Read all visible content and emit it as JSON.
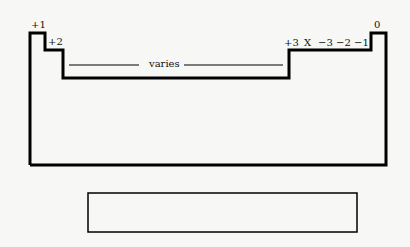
{
  "diagram": {
    "type": "periodic-table-outline",
    "group_labels": {
      "g1": "+1",
      "g2": "+2",
      "transition": "varies",
      "g13": "+3",
      "g14": "X",
      "g15": "−3",
      "g16": "−2",
      "g17": "−1",
      "g18": "0"
    },
    "bottom_box_label": ""
  }
}
